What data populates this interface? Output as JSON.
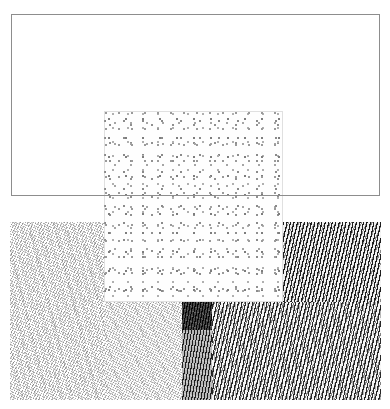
{
  "canvas": {
    "width": 390,
    "height": 409,
    "background_color": "#ffffff",
    "title": "Abstract Texture Composition",
    "description": "Monochrome generative composition: an empty thin-outlined rectangle above, a stippled dot square centred over two contrasting diagonal hatch fields, with a dark vertical bar at the lower centre."
  },
  "regions": {
    "frame_rect": {
      "name": "Outline Rectangle",
      "x": 11,
      "y": 14,
      "width": 369,
      "height": 182,
      "fill": "none",
      "stroke_color": "#8d8d8d",
      "stroke_width": 1,
      "texture": "none"
    },
    "stipple_square": {
      "name": "Stipple Square",
      "x": 104,
      "y": 111,
      "width": 179,
      "height": 191,
      "fill": "#fefefe",
      "dot_color": "#8a8a8a",
      "texture": "random-stipple-dots",
      "density": "medium"
    },
    "left_texture": {
      "name": "Left Hatch Field",
      "x": 10,
      "y": 222,
      "width": 174,
      "height": 178,
      "fill": "#ffffff",
      "stroke_color": "#555555",
      "texture": "fine-diagonal-fur-hatch",
      "tone": "light",
      "angle_deg": 118
    },
    "right_texture": {
      "name": "Right Wave Field",
      "x": 212,
      "y": 222,
      "width": 169,
      "height": 178,
      "fill": "#f4f4f4",
      "stroke_color": "#191919",
      "texture": "wavy-diagonal-stripes",
      "tone": "dark",
      "angle_deg": 102
    },
    "right_texture_upper": {
      "name": "Right Wave Field Upper Band",
      "x": 283,
      "y": 222,
      "width": 98,
      "height": 80,
      "fill": "#f0f0f0",
      "stroke_color": "#141414",
      "texture": "wavy-diagonal-stripes",
      "tone": "dark",
      "angle_deg": 102
    },
    "left_texture_lower": {
      "name": "Left Hatch Field Lower Band",
      "x": 104,
      "y": 302,
      "width": 80,
      "height": 98,
      "fill": "#ffffff",
      "stroke_color": "#555555",
      "texture": "fine-diagonal-fur-hatch",
      "tone": "light",
      "angle_deg": 118
    },
    "dark_bar_top": {
      "name": "Dark Bar Upper Segment",
      "x": 182,
      "y": 302,
      "width": 30,
      "height": 28,
      "fill": "#2b2b2b",
      "texture": "dense-dark-hatch",
      "tone": "very-dark"
    },
    "dark_bar_bottom": {
      "name": "Dark Bar Lower Segment",
      "x": 182,
      "y": 330,
      "width": 30,
      "height": 70,
      "fill": "#6e6e6e",
      "texture": "medium-dark-hatch",
      "tone": "mid-dark"
    }
  },
  "palette": {
    "background": "#ffffff",
    "outline": "#8d8d8d",
    "light_hatch": "#555555",
    "dark_hatch": "#191919",
    "darkest_block": "#2b2b2b",
    "mid_block": "#6e6e6e",
    "stipple": "#8a8a8a"
  }
}
